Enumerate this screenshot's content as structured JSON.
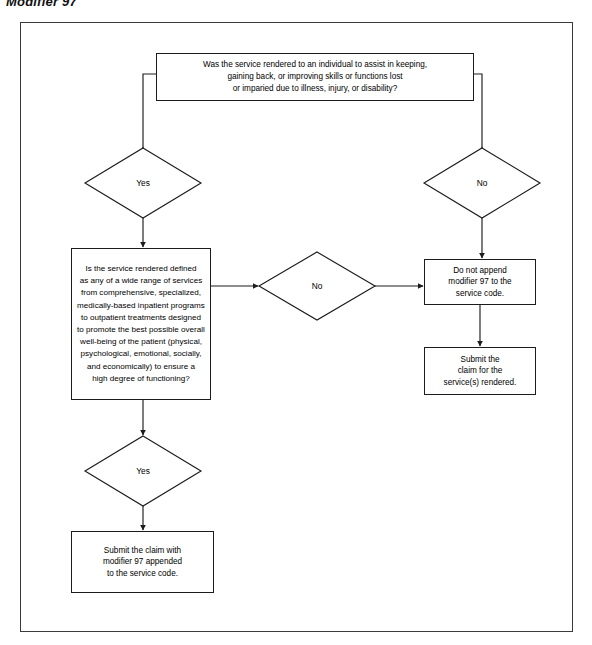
{
  "page": {
    "title": "Modifier 97"
  },
  "colors": {
    "frame_border": "#3a3a3a",
    "node_border": "#1c1c1c",
    "connector": "#1c1c1c",
    "background": "#ffffff",
    "text": "#000000"
  },
  "flowchart": {
    "type": "decision-flowchart",
    "orientation": "top-down",
    "nodes": [
      {
        "id": "question-top",
        "shape": "rectangle",
        "text": "Was the service rendered to an individual to assist in keeping,\ngaining back, or improving skills or functions lost\nor imparied due to illness, injury, or disability?"
      },
      {
        "id": "yes-top",
        "shape": "diamond",
        "text": "Yes"
      },
      {
        "id": "no-top",
        "shape": "diamond",
        "text": "No"
      },
      {
        "id": "big-question",
        "shape": "rectangle",
        "text": "Is the service rendered defined\nas any of a wide range of services\nfrom comprehensive, specialized,\nmedically-based inpatient programs\nto outpatient treatments designed\nto promote the best possible overall\nwell-being of the patient (physical,\npsychological, emotional, socially,\nand economically) to ensure a\nhigh degree of functioning?"
      },
      {
        "id": "no-mid",
        "shape": "diamond",
        "text": "No"
      },
      {
        "id": "do-not-append",
        "shape": "rectangle",
        "text": "Do not append\nmodifier 97 to the\nservice code."
      },
      {
        "id": "submit-plain",
        "shape": "rectangle",
        "text": "Submit the\nclaim for the\nservice(s) rendered."
      },
      {
        "id": "yes-bot",
        "shape": "diamond",
        "text": "Yes"
      },
      {
        "id": "submit-modifier",
        "shape": "rectangle",
        "text": "Submit the claim with\nmodifier 97 appended\nto the service code."
      }
    ],
    "edges": [
      {
        "from": "question-top",
        "to": "yes-top",
        "label": ""
      },
      {
        "from": "question-top",
        "to": "no-top",
        "label": ""
      },
      {
        "from": "yes-top",
        "to": "big-question",
        "label": ""
      },
      {
        "from": "no-top",
        "to": "do-not-append",
        "label": ""
      },
      {
        "from": "big-question",
        "to": "no-mid",
        "label": ""
      },
      {
        "from": "no-mid",
        "to": "do-not-append",
        "label": ""
      },
      {
        "from": "big-question",
        "to": "yes-bot",
        "label": ""
      },
      {
        "from": "do-not-append",
        "to": "submit-plain",
        "label": ""
      },
      {
        "from": "yes-bot",
        "to": "submit-modifier",
        "label": ""
      }
    ]
  }
}
